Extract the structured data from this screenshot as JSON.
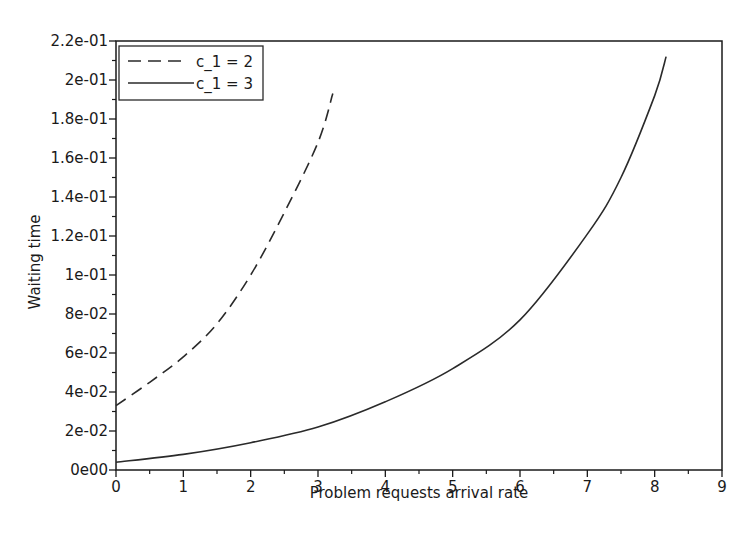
{
  "chart_data": {
    "type": "line",
    "title": "",
    "xlabel": "Problem requests arrival rate",
    "ylabel": "Waiting time",
    "xlim": [
      0,
      9
    ],
    "ylim": [
      0,
      0.22
    ],
    "x_ticks": [
      "0",
      "1",
      "2",
      "3",
      "4",
      "5",
      "6",
      "7",
      "8",
      "9"
    ],
    "y_ticks": [
      "0e00",
      "2e-02",
      "4e-02",
      "6e-02",
      "8e-02",
      "1e-01",
      "1.2e-01",
      "1.4e-01",
      "1.6e-01",
      "1.8e-01",
      "2e-01",
      "2.2e-01"
    ],
    "y_tick_values": [
      0,
      0.02,
      0.04,
      0.06,
      0.08,
      0.1,
      0.12,
      0.14,
      0.16,
      0.18,
      0.2,
      0.22
    ],
    "grid": false,
    "legend_position": "upper left",
    "series": [
      {
        "name": "c_1 = 2",
        "style": "dashed",
        "x": [
          0,
          0.5,
          1.0,
          1.5,
          2.0,
          2.5,
          3.0,
          3.22
        ],
        "values": [
          0.033,
          0.045,
          0.058,
          0.075,
          0.1,
          0.132,
          0.168,
          0.193
        ]
      },
      {
        "name": "c_1 = 3",
        "style": "solid",
        "x": [
          0,
          1,
          2,
          3,
          4,
          5,
          6,
          7,
          7.5,
          8,
          8.17
        ],
        "values": [
          0.004,
          0.008,
          0.014,
          0.022,
          0.035,
          0.052,
          0.077,
          0.121,
          0.15,
          0.192,
          0.212
        ]
      }
    ]
  },
  "colors": {
    "line": "#2a2a2a",
    "axis": "#1a1a1a",
    "background": "#ffffff"
  }
}
